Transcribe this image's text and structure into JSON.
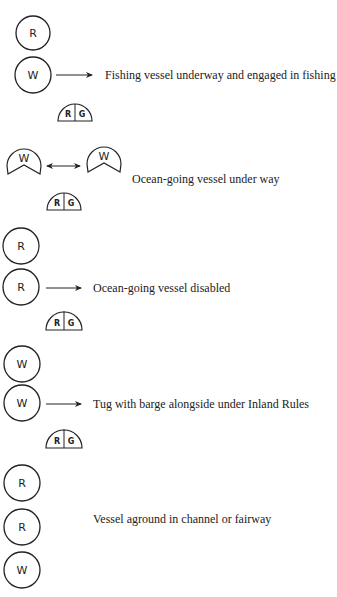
{
  "colors": {
    "ink": "#222222",
    "background": "#ffffff"
  },
  "legend": {
    "R": "red light",
    "G": "green light",
    "W": "white light"
  },
  "groups": [
    {
      "caption": "Fishing vessel underway and engaged in fishing",
      "lights": [
        "R",
        "W"
      ],
      "sidelights": {
        "left": "R",
        "right": "G"
      },
      "arrow": "single"
    },
    {
      "caption": "Ocean-going vessel under way",
      "masthead_lights": [
        "W",
        "W"
      ],
      "sidelights": {
        "left": "R",
        "right": "G"
      },
      "arrow": "double"
    },
    {
      "caption": "Ocean-going vessel disabled",
      "lights": [
        "R",
        "R"
      ],
      "sidelights": {
        "left": "R",
        "right": "G"
      },
      "arrow": "single"
    },
    {
      "caption": "Tug with barge alongside under Inland Rules",
      "lights": [
        "W",
        "W"
      ],
      "sidelights": {
        "left": "R",
        "right": "G"
      },
      "arrow": "single"
    },
    {
      "caption": "Vessel aground in channel or fairway",
      "lights": [
        "R",
        "R",
        "W"
      ],
      "arrow": "none"
    }
  ]
}
